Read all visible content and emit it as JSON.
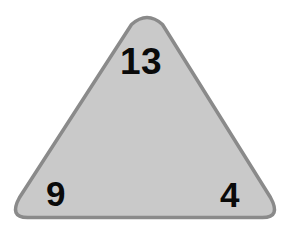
{
  "figure": {
    "type": "triangle-diagram",
    "shape_name": "triangle",
    "background_color": "#ffffff",
    "fill_color": "#c9c9c9",
    "border_color": "#8a8a8a",
    "border_width": 3.5,
    "corner_style": "rounded",
    "vertices": {
      "apex": {
        "x": 147,
        "y": 12
      },
      "bottom_left": {
        "x": 17,
        "y": 219
      },
      "bottom_right": {
        "x": 274,
        "y": 219
      }
    },
    "labels": {
      "top": "13",
      "bottom_left": "9",
      "bottom_right": "4"
    },
    "label_color": "#0a0a0a"
  }
}
